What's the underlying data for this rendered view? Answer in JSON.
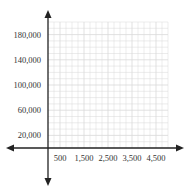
{
  "chart_data": {
    "type": "scatter",
    "title": "",
    "xlabel": "",
    "ylabel": "",
    "x_ticks": [
      500,
      1500,
      2500,
      3500,
      4500
    ],
    "x_tick_labels": [
      "500",
      "1,500",
      "2,500",
      "3,500",
      "4,500"
    ],
    "y_ticks": [
      20000,
      60000,
      100000,
      140000,
      180000
    ],
    "y_tick_labels": [
      "20,000",
      "60,000",
      "100,000",
      "140,000",
      "180,000"
    ],
    "xlim": [
      0,
      5000
    ],
    "ylim": [
      0,
      200000
    ],
    "grid": true,
    "series": []
  },
  "colors": {
    "axis": "#222222",
    "grid": "#d9d9d9",
    "label": "#333333"
  }
}
